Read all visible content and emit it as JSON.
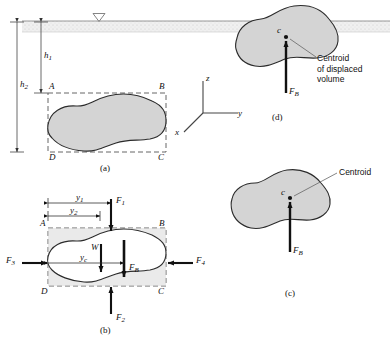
{
  "figure": {
    "panels": [
      {
        "id": "a",
        "label": "(a)",
        "caption": "submerged body with free-body box ABCD"
      },
      {
        "id": "b",
        "label": "(b)",
        "caption": "free-body diagram of forces"
      },
      {
        "id": "c",
        "label": "(c)",
        "caption": "fully submerged body, centroid"
      },
      {
        "id": "d",
        "label": "(d)",
        "caption": "floating body, centroid of displaced volume"
      }
    ]
  },
  "panel_a": {
    "depth_labels": [
      {
        "name": "h1",
        "text": "h",
        "sub": "1"
      },
      {
        "name": "h2",
        "text": "h",
        "sub": "2"
      }
    ],
    "corners": [
      "A",
      "B",
      "C",
      "D"
    ],
    "free_surface_symbol": "free-surface-triangle",
    "panel_label": "(a)"
  },
  "panel_b": {
    "dimension_labels": [
      {
        "name": "y1",
        "text": "y",
        "sub": "1"
      },
      {
        "name": "y2",
        "text": "y",
        "sub": "2"
      },
      {
        "name": "yc",
        "text": "y",
        "sub": "c"
      }
    ],
    "forces": [
      {
        "name": "F1",
        "text": "F",
        "sub": "1",
        "direction": "down"
      },
      {
        "name": "F2",
        "text": "F",
        "sub": "2",
        "direction": "up"
      },
      {
        "name": "F3",
        "text": "F",
        "sub": "3",
        "direction": "right"
      },
      {
        "name": "F4",
        "text": "F",
        "sub": "4",
        "direction": "left"
      },
      {
        "name": "W",
        "text": "W",
        "sub": "",
        "direction": "down"
      },
      {
        "name": "FB",
        "text": "F",
        "sub": "B",
        "direction": "down"
      }
    ],
    "corners": [
      "A",
      "B",
      "C",
      "D"
    ],
    "panel_label": "(b)"
  },
  "panel_c": {
    "centroid_marker": "c",
    "annotation": "Centroid",
    "force": {
      "name": "FB",
      "text": "F",
      "sub": "B",
      "direction": "up"
    },
    "panel_label": "(c)"
  },
  "panel_d": {
    "centroid_marker": "c",
    "annotation_lines": [
      "Centroid",
      "of displaced",
      "volume"
    ],
    "force": {
      "name": "FB",
      "text": "F",
      "sub": "B",
      "direction": "up"
    },
    "panel_label": "(d)"
  },
  "axes": {
    "z": "z",
    "y": "y",
    "x": "x"
  },
  "colors": {
    "body_fill": "#d4d4d4",
    "body_stroke": "#2b2b2b",
    "water_band": "#ededed",
    "dashed": "#555555",
    "arrow": "#111111",
    "text": "#111111"
  }
}
